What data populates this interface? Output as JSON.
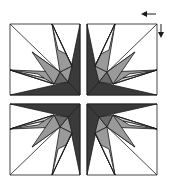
{
  "diagram": {
    "type": "quilt-block",
    "colors": {
      "background": "#ffffff",
      "outline": "#1a1a1a",
      "dark": "#3a3a3a",
      "medium_dark": "#6a6a6a",
      "medium": "#9a9a9a",
      "light": "#d0d0d0"
    },
    "quadrants": [
      "top-left",
      "top-right",
      "bottom-left",
      "bottom-right"
    ],
    "annotations": {
      "arrows": [
        "left-arrow",
        "down-arrow"
      ]
    }
  }
}
